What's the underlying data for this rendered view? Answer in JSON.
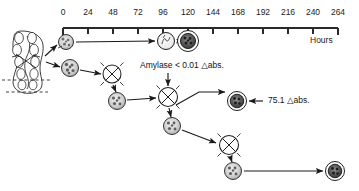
{
  "figure": {
    "kind": "timeline-cell-lineage-diagram",
    "axis": {
      "label": "Hours",
      "min": 0,
      "max": 264,
      "step": 24,
      "ticks": [
        "0",
        "24",
        "48",
        "72",
        "96",
        "120",
        "144",
        "168",
        "192",
        "216",
        "240",
        "264"
      ]
    },
    "annotations": [
      {
        "id": "amylase-low",
        "text": "Amylase",
        "operator": "<",
        "value": "0.01",
        "unit": "abs.",
        "symbol": "△",
        "full": "Amylase < 0.01 △abs."
      },
      {
        "id": "amylase-high",
        "value": "75.1",
        "unit": "abs.",
        "symbol": "△",
        "full": "75.1 △abs."
      }
    ],
    "nodes": [
      {
        "id": "tissue",
        "name": "pancreatic-acinus-tissue",
        "type": "tissue",
        "x": 27,
        "y": 62,
        "r": 0
      },
      {
        "id": "c0a",
        "name": "isolated-cell-upper",
        "type": "granular-cell",
        "x": 66,
        "y": 42,
        "r": 7.5
      },
      {
        "id": "c0b",
        "name": "isolated-cell-lower",
        "type": "granular-cell",
        "x": 70,
        "y": 68,
        "r": 8.5
      },
      {
        "id": "c96",
        "name": "cell-at-96h",
        "type": "pale-cell",
        "x": 166,
        "y": 41,
        "r": 8.5
      },
      {
        "id": "c120",
        "name": "cell-at-120h",
        "type": "dark-cell",
        "x": 188,
        "y": 41,
        "r": 10.5
      },
      {
        "id": "d1",
        "name": "dividing-cell-1",
        "type": "mitotic-cell",
        "x": 112,
        "y": 74,
        "r": 9
      },
      {
        "id": "g1",
        "name": "daughter-cell-1",
        "type": "granular-cell",
        "x": 117,
        "y": 101,
        "r": 8.5
      },
      {
        "id": "d2",
        "name": "dividing-cell-2",
        "type": "mitotic-cell",
        "x": 168,
        "y": 97,
        "r": 9.5
      },
      {
        "id": "g2",
        "name": "daughter-cell-2",
        "type": "granular-cell",
        "x": 172,
        "y": 126,
        "r": 8.5
      },
      {
        "id": "cR",
        "name": "dark-cell-right",
        "type": "dark-cell",
        "x": 237,
        "y": 101,
        "r": 9.5
      },
      {
        "id": "d3",
        "name": "dividing-cell-3",
        "type": "mitotic-cell",
        "x": 229,
        "y": 145,
        "r": 9.5
      },
      {
        "id": "g3",
        "name": "daughter-cell-3",
        "type": "granular-cell",
        "x": 233,
        "y": 171,
        "r": 8.5
      },
      {
        "id": "cE",
        "name": "dark-cell-final",
        "type": "dark-cell",
        "x": 335,
        "y": 171,
        "r": 9.5
      }
    ],
    "colors": {
      "ink": "#1a1a1a",
      "axis": "#2a2a2a",
      "cell_fill": "#ffffff",
      "granule": "#6e6e6e",
      "dark_cell": "#3a3a3a"
    }
  }
}
